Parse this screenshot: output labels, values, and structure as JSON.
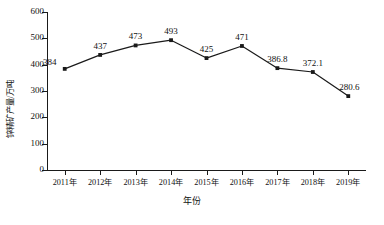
{
  "chart_data": {
    "type": "line",
    "title": "",
    "xlabel": "年份",
    "ylabel": "锌精矿产量/万吨",
    "categories": [
      "2011年",
      "2012年",
      "2013年",
      "2014年",
      "2015年",
      "2016年",
      "2017年",
      "2018年",
      "2019年"
    ],
    "values": [
      384,
      437,
      473,
      493,
      425,
      471,
      386.8,
      372.1,
      280.6
    ],
    "point_labels": [
      "384",
      "437",
      "473",
      "493",
      "425",
      "471",
      "386.8",
      "372.1",
      "280.6"
    ],
    "ylim": [
      0,
      600
    ],
    "yticks": [
      0,
      100,
      200,
      300,
      400,
      500,
      600
    ],
    "ytick_labels": [
      "0",
      "100",
      "200",
      "300",
      "400",
      "500",
      "600"
    ],
    "grid": false,
    "legend": false,
    "legend_position": "none",
    "series_color": "#1a1a1a",
    "marker": "square",
    "background_color": "#ffffff"
  }
}
